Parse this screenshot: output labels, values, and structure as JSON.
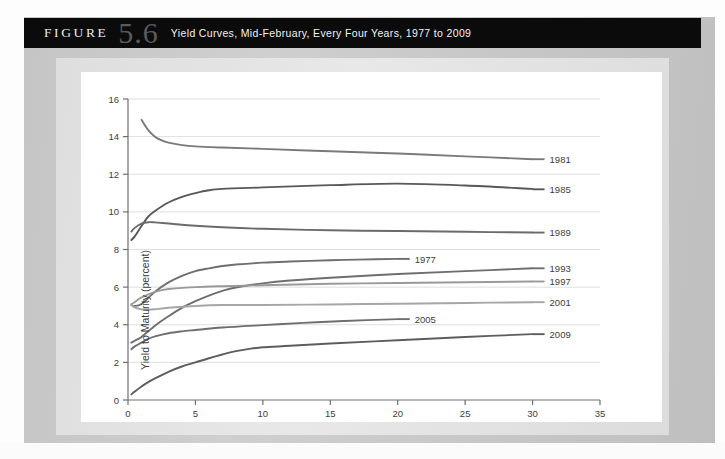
{
  "header": {
    "figure_word": "FIGURE",
    "figure_number": "5.6",
    "caption": "Yield Curves, Mid-February, Every Four Years, 1977 to 2009"
  },
  "chart_data": {
    "type": "line",
    "title": "Yield Curves, Mid-February, Every Four Years, 1977 to 2009",
    "xlabel": "Time to Maturity (years)",
    "ylabel": "Yield to Maturity (percent)",
    "xlim": [
      0,
      35
    ],
    "ylim": [
      0,
      16
    ],
    "xticks": [
      "0",
      "5",
      "10",
      "15",
      "20",
      "25",
      "30",
      "35"
    ],
    "yticks": [
      "0",
      "2",
      "4",
      "6",
      "8",
      "10",
      "12",
      "14",
      "16"
    ],
    "grid": "horizontal",
    "legend_position": "right-of-line-ends",
    "series": [
      {
        "name": "1977",
        "color": "#6e6e6e",
        "label_x": 20,
        "label_y": 7.5,
        "x": [
          0.25,
          0.5,
          1,
          2,
          3,
          4,
          5,
          6,
          7,
          8,
          10,
          12,
          15,
          17,
          20
        ],
        "y": [
          5.05,
          5.0,
          5.1,
          5.75,
          6.25,
          6.6,
          6.85,
          7.0,
          7.12,
          7.2,
          7.3,
          7.36,
          7.43,
          7.46,
          7.5
        ]
      },
      {
        "name": "1981",
        "color": "#7a7a7a",
        "label_x": 30,
        "label_y": 12.8,
        "x": [
          1,
          1.5,
          2,
          2.5,
          3,
          4,
          5,
          7,
          10,
          15,
          20,
          25,
          30
        ],
        "y": [
          14.9,
          14.35,
          14.0,
          13.8,
          13.68,
          13.55,
          13.48,
          13.42,
          13.35,
          13.22,
          13.1,
          12.95,
          12.8
        ]
      },
      {
        "name": "1985",
        "color": "#585858",
        "label_x": 30,
        "label_y": 11.2,
        "x": [
          0.25,
          0.5,
          1,
          1.5,
          2,
          3,
          4,
          5,
          6,
          7,
          10,
          15,
          20,
          25,
          30
        ],
        "y": [
          8.5,
          8.7,
          9.25,
          9.75,
          10.05,
          10.5,
          10.8,
          11.0,
          11.15,
          11.22,
          11.3,
          11.42,
          11.5,
          11.4,
          11.22
        ]
      },
      {
        "name": "1989",
        "color": "#6b6b6b",
        "label_x": 30,
        "label_y": 8.9,
        "x": [
          0.25,
          0.5,
          1,
          1.5,
          2,
          3,
          5,
          7,
          10,
          15,
          20,
          25,
          30
        ],
        "y": [
          8.95,
          9.15,
          9.38,
          9.45,
          9.44,
          9.38,
          9.26,
          9.18,
          9.1,
          9.02,
          8.98,
          8.94,
          8.9
        ]
      },
      {
        "name": "1993",
        "color": "#6e6e6e",
        "label_x": 30,
        "label_y": 7.0,
        "x": [
          0.25,
          0.5,
          1,
          2,
          3,
          4,
          5,
          6,
          7,
          8,
          10,
          12,
          15,
          20,
          25,
          30
        ],
        "y": [
          3.05,
          3.15,
          3.35,
          3.95,
          4.45,
          4.9,
          5.25,
          5.55,
          5.8,
          5.98,
          6.2,
          6.35,
          6.5,
          6.7,
          6.85,
          7.0
        ]
      },
      {
        "name": "1997",
        "color": "#9a9a9a",
        "label_x": 30,
        "label_y": 6.3,
        "x": [
          0.25,
          0.5,
          1,
          2,
          3,
          5,
          7,
          10,
          15,
          20,
          25,
          30
        ],
        "y": [
          5.1,
          5.2,
          5.45,
          5.75,
          5.9,
          6.0,
          6.05,
          6.1,
          6.18,
          6.22,
          6.26,
          6.3
        ]
      },
      {
        "name": "2001",
        "color": "#a6a6a6",
        "label_x": 30,
        "label_y": 5.2,
        "x": [
          0.25,
          0.5,
          1,
          1.5,
          2,
          3,
          5,
          7,
          10,
          15,
          20,
          25,
          30
        ],
        "y": [
          5.05,
          4.92,
          4.82,
          4.8,
          4.82,
          4.9,
          5.0,
          5.05,
          5.05,
          5.08,
          5.12,
          5.16,
          5.2
        ]
      },
      {
        "name": "2005",
        "color": "#6e6e6e",
        "label_x": 20,
        "label_y": 4.3,
        "x": [
          0.25,
          0.5,
          1,
          1.5,
          2,
          3,
          4,
          5,
          7,
          10,
          13,
          16,
          20
        ],
        "y": [
          2.7,
          2.85,
          3.05,
          3.25,
          3.38,
          3.55,
          3.65,
          3.72,
          3.85,
          3.98,
          4.1,
          4.2,
          4.3
        ]
      },
      {
        "name": "2009",
        "color": "#5d5d5d",
        "label_x": 30,
        "label_y": 3.5,
        "x": [
          0.25,
          0.5,
          1,
          1.5,
          2,
          3,
          4,
          5,
          6,
          7,
          8,
          9,
          10,
          12,
          15,
          20,
          25,
          30
        ],
        "y": [
          0.3,
          0.45,
          0.72,
          0.95,
          1.15,
          1.5,
          1.78,
          2.0,
          2.22,
          2.42,
          2.6,
          2.72,
          2.8,
          2.88,
          3.0,
          3.18,
          3.35,
          3.5
        ]
      }
    ]
  }
}
